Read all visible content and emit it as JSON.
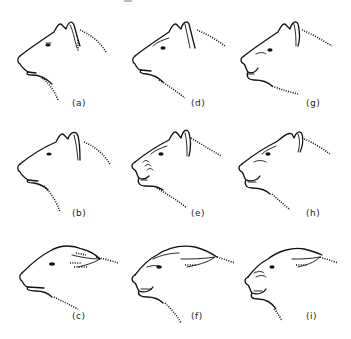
{
  "figure": {
    "panels": [
      {
        "id": "a",
        "label": "(a)",
        "column": 1,
        "row": 1,
        "ears": "erect",
        "mouth": "closed",
        "teeth": false
      },
      {
        "id": "b",
        "label": "(b)",
        "column": 1,
        "row": 2,
        "ears": "erect",
        "mouth": "closed",
        "teeth": false
      },
      {
        "id": "c",
        "label": "(c)",
        "column": 1,
        "row": 3,
        "ears": "flattened",
        "mouth": "closed",
        "teeth": false
      },
      {
        "id": "d",
        "label": "(d)",
        "column": 2,
        "row": 1,
        "ears": "erect",
        "mouth": "slightly open",
        "teeth": false
      },
      {
        "id": "e",
        "label": "(e)",
        "column": 2,
        "row": 2,
        "ears": "erect",
        "mouth": "open snarl",
        "teeth": true
      },
      {
        "id": "f",
        "label": "(f)",
        "column": 2,
        "row": 3,
        "ears": "flattened",
        "mouth": "open snarl",
        "teeth": true
      },
      {
        "id": "g",
        "label": "(g)",
        "column": 3,
        "row": 1,
        "ears": "erect",
        "mouth": "slightly open",
        "teeth": true
      },
      {
        "id": "h",
        "label": "(h)",
        "column": 3,
        "row": 2,
        "ears": "erect",
        "mouth": "open snarl",
        "teeth": true
      },
      {
        "id": "i",
        "label": "(i)",
        "column": 3,
        "row": 3,
        "ears": "flattened",
        "mouth": "open snarl",
        "teeth": true
      }
    ]
  },
  "colors": {
    "background": "#ffffff",
    "line": "#111111",
    "label": "#222222"
  }
}
